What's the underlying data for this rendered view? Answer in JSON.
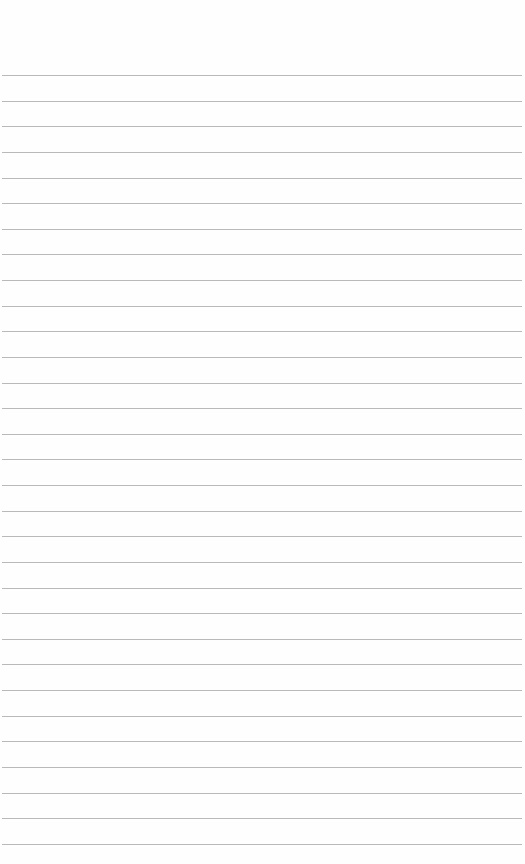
{
  "page": {
    "type": "lined-paper",
    "background": "#fefefe",
    "rule_color": "#b9b9b9",
    "rule_count": 31,
    "first_rule_y": 75,
    "rule_spacing": 25.63
  }
}
